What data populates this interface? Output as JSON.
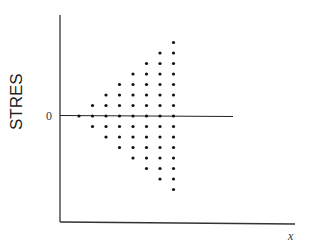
{
  "chart_data": {
    "type": "scatter",
    "title": "",
    "xlabel": "x",
    "ylabel": "STRES",
    "yticks": [
      "0"
    ],
    "reference_line": {
      "y": 0,
      "label": "0"
    },
    "grid": false,
    "legend": "none",
    "x_positions": [
      1,
      2,
      3,
      4,
      5,
      6,
      7,
      8
    ],
    "series": [
      {
        "name": "standardized residuals",
        "points": [
          {
            "x": 1,
            "y": 0
          },
          {
            "x": 2,
            "y": 1
          },
          {
            "x": 2,
            "y": 0
          },
          {
            "x": 2,
            "y": -1
          },
          {
            "x": 3,
            "y": 2
          },
          {
            "x": 3,
            "y": 1
          },
          {
            "x": 3,
            "y": 0
          },
          {
            "x": 3,
            "y": -1
          },
          {
            "x": 3,
            "y": -2
          },
          {
            "x": 4,
            "y": 3
          },
          {
            "x": 4,
            "y": 2
          },
          {
            "x": 4,
            "y": 1
          },
          {
            "x": 4,
            "y": 0
          },
          {
            "x": 4,
            "y": -1
          },
          {
            "x": 4,
            "y": -2
          },
          {
            "x": 4,
            "y": -3
          },
          {
            "x": 5,
            "y": 4
          },
          {
            "x": 5,
            "y": 3
          },
          {
            "x": 5,
            "y": 2
          },
          {
            "x": 5,
            "y": 1
          },
          {
            "x": 5,
            "y": 0
          },
          {
            "x": 5,
            "y": -1
          },
          {
            "x": 5,
            "y": -2
          },
          {
            "x": 5,
            "y": -3
          },
          {
            "x": 5,
            "y": -4
          },
          {
            "x": 6,
            "y": 5
          },
          {
            "x": 6,
            "y": 4
          },
          {
            "x": 6,
            "y": 3
          },
          {
            "x": 6,
            "y": 2
          },
          {
            "x": 6,
            "y": 1
          },
          {
            "x": 6,
            "y": 0
          },
          {
            "x": 6,
            "y": -1
          },
          {
            "x": 6,
            "y": -2
          },
          {
            "x": 6,
            "y": -3
          },
          {
            "x": 6,
            "y": -4
          },
          {
            "x": 6,
            "y": -5
          },
          {
            "x": 7,
            "y": 6
          },
          {
            "x": 7,
            "y": 5
          },
          {
            "x": 7,
            "y": 4
          },
          {
            "x": 7,
            "y": 3
          },
          {
            "x": 7,
            "y": 2
          },
          {
            "x": 7,
            "y": 1
          },
          {
            "x": 7,
            "y": 0
          },
          {
            "x": 7,
            "y": -1
          },
          {
            "x": 7,
            "y": -2
          },
          {
            "x": 7,
            "y": -3
          },
          {
            "x": 7,
            "y": -4
          },
          {
            "x": 7,
            "y": -5
          },
          {
            "x": 7,
            "y": -6
          },
          {
            "x": 8,
            "y": 7
          },
          {
            "x": 8,
            "y": 6
          },
          {
            "x": 8,
            "y": 5
          },
          {
            "x": 8,
            "y": 4
          },
          {
            "x": 8,
            "y": 3
          },
          {
            "x": 8,
            "y": 2
          },
          {
            "x": 8,
            "y": 1
          },
          {
            "x": 8,
            "y": 0
          },
          {
            "x": 8,
            "y": -1
          },
          {
            "x": 8,
            "y": -2
          },
          {
            "x": 8,
            "y": -3
          },
          {
            "x": 8,
            "y": -4
          },
          {
            "x": 8,
            "y": -5
          },
          {
            "x": 8,
            "y": -6
          },
          {
            "x": 8,
            "y": -7
          }
        ]
      }
    ],
    "xlim": [
      -0.4,
      17
    ],
    "ylim": [
      -10,
      10
    ]
  }
}
